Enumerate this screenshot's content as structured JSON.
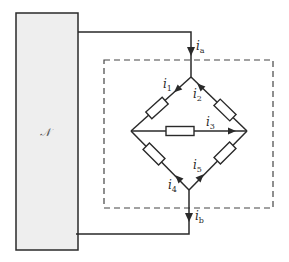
{
  "diagram": {
    "type": "circuit",
    "colors": {
      "line": "#2a2a2a",
      "network_fill": "#eeeeee",
      "dashed_box": "#444444",
      "background": "#ffffff"
    },
    "network": {
      "label": "𝒩"
    },
    "terminal_currents": [
      {
        "id": "ia",
        "symbol": "i",
        "sub": "a",
        "direction": "down"
      },
      {
        "id": "ib",
        "symbol": "i",
        "sub": "b",
        "direction": "down"
      }
    ],
    "branch_currents": [
      {
        "id": "i1",
        "symbol": "i",
        "sub": "1",
        "branch": "top-left",
        "direction": "down-left"
      },
      {
        "id": "i2",
        "symbol": "i",
        "sub": "2",
        "branch": "top-right",
        "direction": "up-left"
      },
      {
        "id": "i3",
        "symbol": "i",
        "sub": "3",
        "branch": "middle",
        "direction": "right"
      },
      {
        "id": "i4",
        "symbol": "i",
        "sub": "4",
        "branch": "bottom-left",
        "direction": "up-left"
      },
      {
        "id": "i5",
        "symbol": "i",
        "sub": "5",
        "branch": "bottom-right",
        "direction": "up-right"
      }
    ],
    "resistor_count": 5
  }
}
